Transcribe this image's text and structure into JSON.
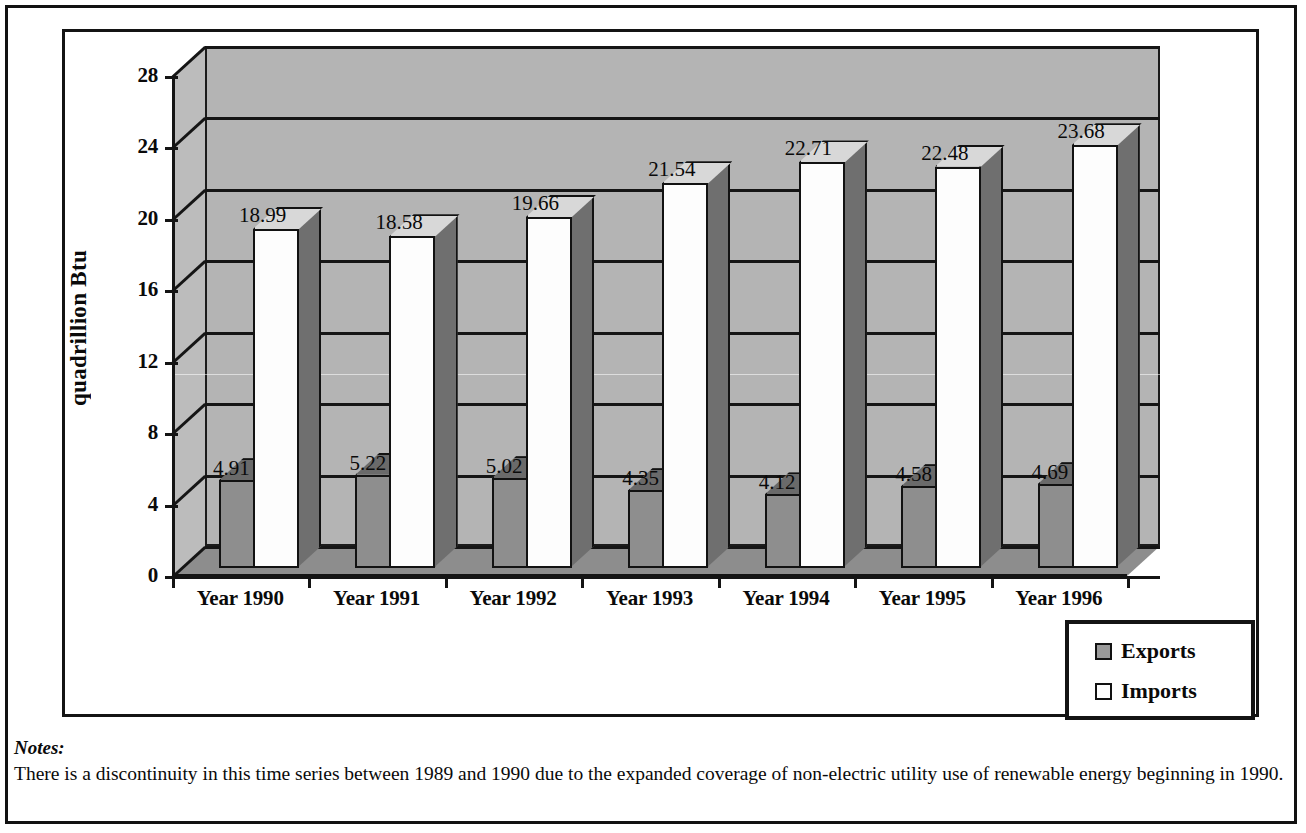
{
  "chart_data": {
    "type": "bar",
    "title": "",
    "xlabel": "",
    "ylabel": "quadrillion Btu",
    "categories": [
      "Year 1990",
      "Year 1991",
      "Year 1992",
      "Year 1993",
      "Year 1994",
      "Year 1995",
      "Year 1996"
    ],
    "series": [
      {
        "name": "Exports",
        "values": [
          4.91,
          5.22,
          5.02,
          4.35,
          4.12,
          4.58,
          4.69
        ],
        "color": "#8e8e8e"
      },
      {
        "name": "Imports",
        "values": [
          18.99,
          18.58,
          19.66,
          21.54,
          22.71,
          22.48,
          23.68
        ],
        "color": "#fdfdfd"
      }
    ],
    "ylim": [
      0,
      28
    ],
    "yticks": [
      "0",
      "4",
      "8",
      "12",
      "16",
      "20",
      "24",
      "28"
    ],
    "ytick_values": [
      0,
      4,
      8,
      12,
      16,
      20,
      24,
      28
    ],
    "grid": true,
    "legend_position": "bottom-right",
    "style": "3d-column"
  },
  "legend": {
    "items": [
      {
        "label": "Exports",
        "swatch": "filled-gray-square"
      },
      {
        "label": "Imports",
        "swatch": "empty-white-square"
      }
    ]
  },
  "notes": {
    "title": "Notes:",
    "body": "There is a discontinuity in this time series between 1989 and 1990 due to the expanded coverage of non-electric utility use of renewable energy beginning in 1990."
  },
  "colors": {
    "ink": "#141414",
    "back_wall": "#b4b4b4",
    "side_wall": "#bcbcbc",
    "floor": "#8d8d8d",
    "exports_bar": "#8e8e8e",
    "imports_bar": "#fdfdfd"
  }
}
